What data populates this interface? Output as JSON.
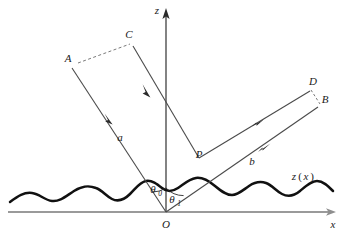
{
  "figure": {
    "colors": {
      "surface": "#111111",
      "ray": "#4a4a4a",
      "axis_z": "#6e6e6e",
      "axis_x": "#9a9a9a",
      "dashed": "#7a7a7a",
      "label": "#1a1a1a",
      "background": "#ffffff"
    },
    "axes": {
      "z_label": "z",
      "x_label": "x",
      "origin_label": "O"
    },
    "points": [
      {
        "id": "A",
        "label": "A",
        "x": 68,
        "y": 62
      },
      {
        "id": "C",
        "label": "C",
        "x": 129,
        "y": 38
      },
      {
        "id": "D",
        "label": "D",
        "x": 313,
        "y": 85
      },
      {
        "id": "B",
        "label": "B",
        "x": 325,
        "y": 103
      },
      {
        "id": "P",
        "label": "P",
        "x": 199,
        "y": 158
      },
      {
        "id": "O",
        "label": "O",
        "x": 166,
        "y": 221
      }
    ],
    "beams": [
      {
        "id": "a",
        "label": "a",
        "x": 120,
        "y": 141,
        "role": "incident-beam"
      },
      {
        "id": "b",
        "label": "b",
        "x": 252,
        "y": 165,
        "role": "scattered-beam"
      }
    ],
    "angles": [
      {
        "id": "theta0",
        "symbol": "θ",
        "subscript": "0",
        "x": 155,
        "y": 193,
        "role": "incidence-angle"
      },
      {
        "id": "theta1",
        "symbol": "θ",
        "subscript": "1",
        "x": 173,
        "y": 202,
        "role": "scattering-angle"
      }
    ],
    "surface": {
      "label_base": "z",
      "label_open": "(",
      "label_var": "x",
      "label_close": ")",
      "label_x": 300,
      "label_y": 180
    }
  }
}
